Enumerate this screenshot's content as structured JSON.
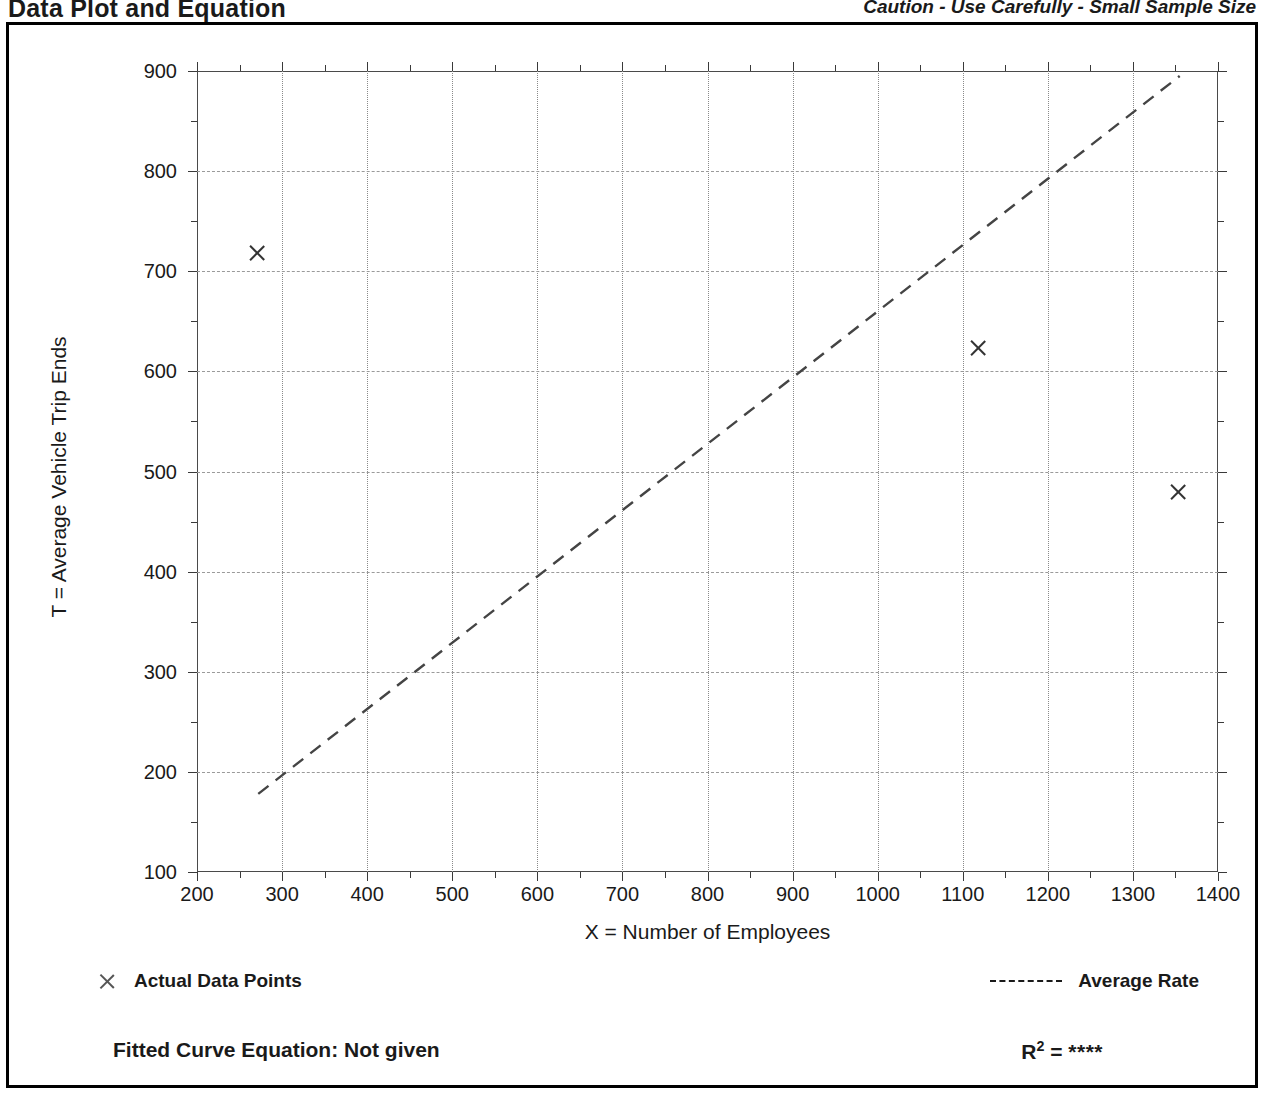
{
  "header": {
    "title": "Data Plot and Equation",
    "caution": "Caution - Use Carefully - Small Sample Size"
  },
  "legend": {
    "data_points_label": "Actual Data Points",
    "data_points_icon": "x-marker-icon",
    "average_rate_label": "Average Rate",
    "average_rate_icon": "dashed-line-icon"
  },
  "footer": {
    "equation_label": "Fitted Curve Equation:  Not given",
    "r2_label": "R",
    "r2_exponent": "2",
    "r2_equals": " = ",
    "r2_value": "****"
  },
  "chart_data": {
    "type": "scatter",
    "title": "Data Plot and Equation",
    "xlabel": "X = Number of Employees",
    "ylabel": "T = Average Vehicle Trip Ends",
    "xlim": [
      200,
      1400
    ],
    "ylim": [
      100,
      900
    ],
    "xticks": [
      200,
      300,
      400,
      500,
      600,
      700,
      800,
      900,
      1000,
      1100,
      1200,
      1300,
      1400
    ],
    "yticks": [
      100,
      200,
      300,
      400,
      500,
      600,
      700,
      800,
      900
    ],
    "xtick_minor_step": 50,
    "ytick_minor_step": 50,
    "grid": true,
    "legend_position": "below-plot",
    "series": [
      {
        "name": "Actual Data Points",
        "type": "scatter",
        "marker": "x",
        "points": [
          {
            "x": 270,
            "y": 718
          },
          {
            "x": 1118,
            "y": 623
          },
          {
            "x": 1353,
            "y": 480
          }
        ]
      },
      {
        "name": "Average Rate",
        "type": "line",
        "style": "dashed",
        "points": [
          {
            "x": 272,
            "y": 178
          },
          {
            "x": 1355,
            "y": 895
          }
        ]
      }
    ]
  }
}
